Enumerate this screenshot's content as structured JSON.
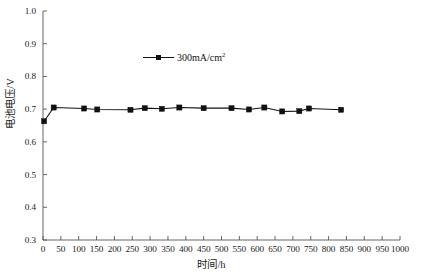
{
  "chart_data": {
    "type": "line",
    "title": "",
    "xlabel": "时间/h",
    "ylabel": "电池电压/V",
    "xlim": [
      0,
      1000
    ],
    "ylim": [
      0.3,
      1.0
    ],
    "grid": false,
    "legend_position": "upper-center",
    "xticks": [
      0,
      50,
      100,
      150,
      200,
      250,
      300,
      350,
      400,
      450,
      500,
      550,
      600,
      650,
      700,
      750,
      800,
      850,
      900,
      950,
      1000
    ],
    "xtick_labels": [
      "0",
      "50",
      "100",
      "150",
      "200",
      "250",
      "300",
      "350",
      "400",
      "450",
      "500",
      "550",
      "600",
      "650",
      "700",
      "750",
      "800",
      "850",
      "900",
      "950",
      "1000"
    ],
    "yticks": [
      0.3,
      0.4,
      0.5,
      0.6,
      0.7,
      0.8,
      0.9,
      1.0
    ],
    "ytick_labels": [
      "0.3",
      "0.4",
      "0.5",
      "0.6",
      "0.7",
      "0.8",
      "0.9",
      "1.0"
    ],
    "series": [
      {
        "name": "300mA/cm²",
        "name_base": "300mA/cm",
        "name_sup": "2",
        "color": "#111111",
        "marker": "square",
        "x": [
          3,
          30,
          115,
          152,
          245,
          285,
          333,
          382,
          450,
          528,
          577,
          620,
          670,
          718,
          745,
          835
        ],
        "y": [
          0.663,
          0.705,
          0.702,
          0.699,
          0.698,
          0.703,
          0.701,
          0.705,
          0.703,
          0.703,
          0.699,
          0.705,
          0.693,
          0.694,
          0.702,
          0.698
        ]
      }
    ]
  },
  "legend": {
    "entries": [
      {
        "label_base": "300mA/cm",
        "label_sup": "2"
      }
    ]
  },
  "axes": {
    "x_title": "时间/h",
    "y_title": "电池电压/V"
  }
}
